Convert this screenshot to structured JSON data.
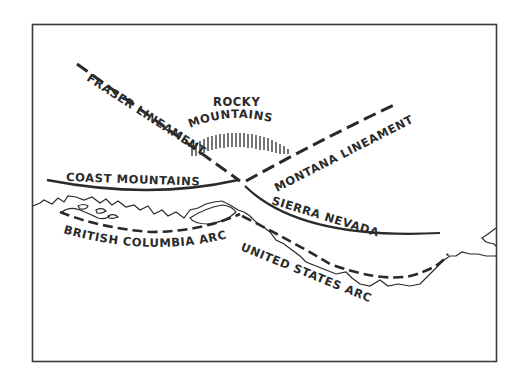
{
  "figure": {
    "type": "tectonic sketch map",
    "frame_color": "#3a3a3a",
    "ink_color": "#2a2a2a"
  },
  "labels": {
    "rocky_line1": "ROCKY",
    "rocky_line2": "MOUNTAINS",
    "fraser": "FRASER LINEAMENT",
    "montana": "MONTANA LINEAMENT",
    "coast": "COAST MOUNTAINS",
    "sierra": "SIERRA NEVADA",
    "bc_arc": "BRITISH COLUMBIA ARC",
    "us_arc": "UNITED STATES ARC"
  },
  "features": [
    {
      "name": "Fraser Lineament",
      "style": "dashed"
    },
    {
      "name": "Montana Lineament",
      "style": "dashed"
    },
    {
      "name": "Coast Mountains",
      "style": "solid"
    },
    {
      "name": "Sierra Nevada",
      "style": "solid"
    },
    {
      "name": "Rocky Mountains",
      "style": "hachure"
    },
    {
      "name": "British Columbia Arc",
      "style": "dashed"
    },
    {
      "name": "United States Arc",
      "style": "dashed"
    },
    {
      "name": "Coastline",
      "style": "thin solid"
    }
  ]
}
